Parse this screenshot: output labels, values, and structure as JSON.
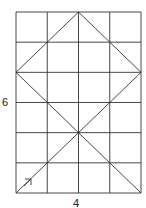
{
  "diagram": {
    "type": "grid-figure",
    "grid": {
      "columns": 4,
      "rows": 6
    },
    "labels": {
      "height": "6",
      "width": "4"
    },
    "segments_grid_units": [
      {
        "name": "diamond-top-left-edge",
        "from": [
          2,
          0
        ],
        "to": [
          0,
          2
        ]
      },
      {
        "name": "diamond-top-right-edge",
        "from": [
          2,
          0
        ],
        "to": [
          4,
          2
        ]
      },
      {
        "name": "diagonal-left-to-bottom-right",
        "from": [
          0,
          2
        ],
        "to": [
          4,
          6
        ]
      },
      {
        "name": "diagonal-right-to-bottom-left",
        "from": [
          4,
          2
        ],
        "to": [
          0,
          6
        ]
      }
    ],
    "arrow": {
      "direction": "up-right",
      "along": "diagonal-right-to-bottom-left"
    },
    "colors": {
      "line": "#333333",
      "background": "#ffffff"
    }
  }
}
